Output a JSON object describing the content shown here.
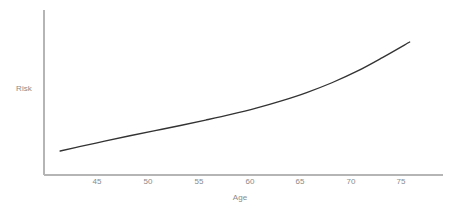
{
  "figure": {
    "background_color": "#ffffff",
    "width": 456,
    "height": 212
  },
  "chart_data": {
    "type": "line",
    "title": "",
    "subtitle": "",
    "xlabel": "Age",
    "ylabel": "Risk",
    "grid": false,
    "legend": null,
    "legend_position": "none",
    "line_color": "#333333",
    "axis_color": "#b5b5b5",
    "tick_label_color": "#8a8a8a",
    "xlim": [
      41.5,
      81.0
    ],
    "ylim": [
      0,
      1
    ],
    "x_ticks": [
      45,
      50,
      55,
      60,
      65,
      70,
      75
    ],
    "x_tick_labels": [
      "45",
      "50",
      "55",
      "60",
      "65",
      "70",
      "75"
    ],
    "y_ticks": [],
    "y_tick_labels": [],
    "x": [
      43.1,
      45.0,
      47.5,
      50.0,
      52.5,
      55.0,
      57.5,
      60.0,
      62.5,
      65.0,
      67.5,
      70.0,
      72.5,
      75.0,
      77.7
    ],
    "values": [
      0.112,
      0.147,
      0.192,
      0.236,
      0.278,
      0.32,
      0.364,
      0.41,
      0.461,
      0.52,
      0.588,
      0.668,
      0.762,
      0.873,
      1.0
    ],
    "series": [
      {
        "name": "Risk",
        "x": [
          43.1,
          45.0,
          47.5,
          50.0,
          52.5,
          55.0,
          57.5,
          60.0,
          62.5,
          65.0,
          67.5,
          70.0,
          72.5,
          75.0,
          77.7
        ],
        "values": [
          0.112,
          0.147,
          0.192,
          0.236,
          0.278,
          0.32,
          0.364,
          0.41,
          0.461,
          0.52,
          0.588,
          0.668,
          0.762,
          0.873,
          1.0
        ]
      }
    ],
    "annotations": []
  },
  "axis_labels": {
    "x_title": "Age",
    "y_title": "Risk"
  },
  "x_tick_items": [
    {
      "label": "45",
      "left": 97
    },
    {
      "label": "50",
      "left": 148
    },
    {
      "label": "55",
      "left": 199
    },
    {
      "label": "60",
      "left": 250
    },
    {
      "label": "65",
      "left": 300
    },
    {
      "label": "70",
      "left": 351
    },
    {
      "label": "75",
      "left": 401
    }
  ]
}
